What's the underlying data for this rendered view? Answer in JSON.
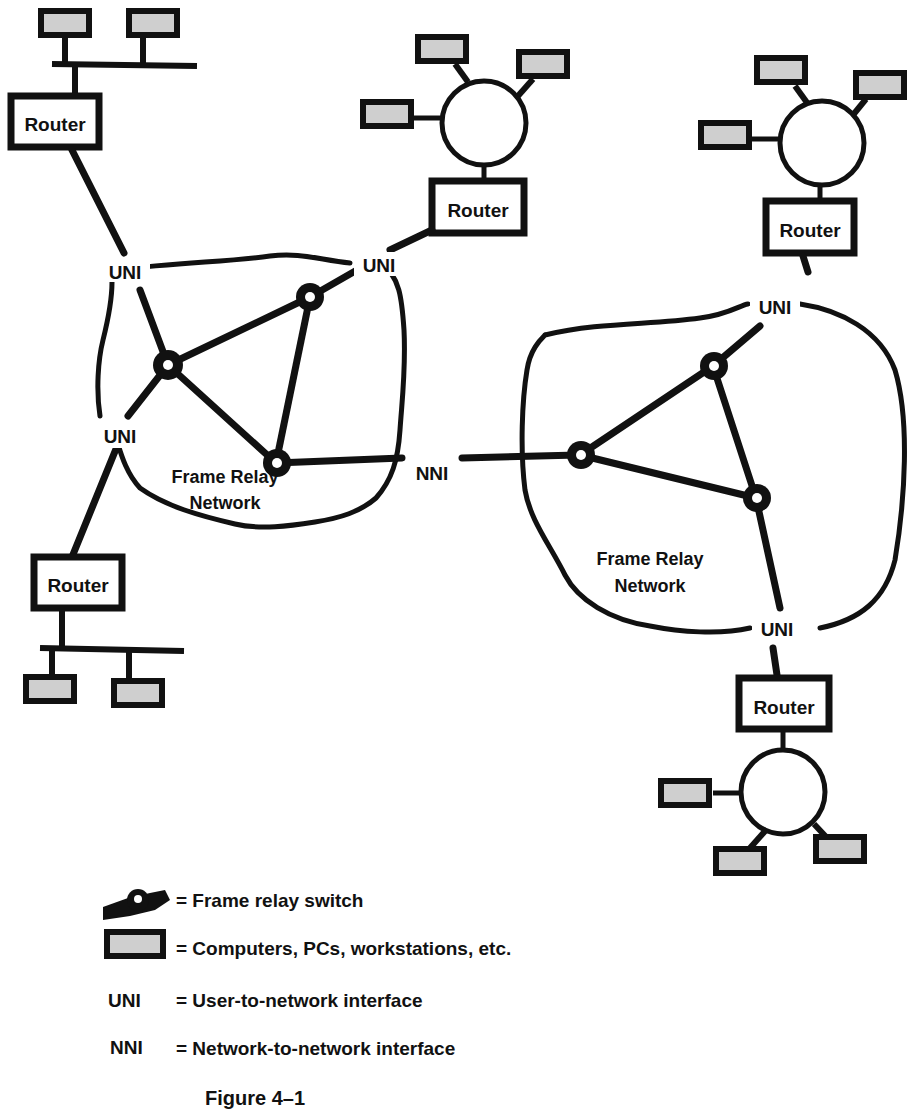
{
  "diagram": {
    "routers": [
      {
        "id": "router-top-left",
        "label": "Router"
      },
      {
        "id": "router-top-middle",
        "label": "Router"
      },
      {
        "id": "router-top-right",
        "label": "Router"
      },
      {
        "id": "router-bottom-left",
        "label": "Router"
      },
      {
        "id": "router-bottom-right",
        "label": "Router"
      }
    ],
    "interfaces": [
      {
        "id": "uni-left-top",
        "label": "UNI"
      },
      {
        "id": "uni-left-middle-top",
        "label": "UNI"
      },
      {
        "id": "uni-left-bottom",
        "label": "UNI"
      },
      {
        "id": "nni-center",
        "label": "NNI"
      },
      {
        "id": "uni-right-top",
        "label": "UNI"
      },
      {
        "id": "uni-right-bottom",
        "label": "UNI"
      }
    ],
    "networks": [
      {
        "id": "left-cloud",
        "line1": "Frame Relay",
        "line2": "Network"
      },
      {
        "id": "right-cloud",
        "line1": "Frame Relay",
        "line2": "Network"
      }
    ]
  },
  "legend": {
    "items": [
      {
        "key": "",
        "icon": "frame-relay-switch-icon",
        "text": "= Frame relay switch"
      },
      {
        "key": "",
        "icon": "computer-icon",
        "text": "= Computers, PCs, workstations, etc."
      },
      {
        "key": "UNI",
        "icon": "",
        "text": "= User-to-network  interface"
      },
      {
        "key": "NNI",
        "icon": "",
        "text": "= Network-to-network  interface"
      }
    ]
  },
  "caption": "Figure 4–1",
  "colors": {
    "ink": "#111111",
    "computer_fill": "#cfcfcf",
    "background": "#ffffff"
  }
}
